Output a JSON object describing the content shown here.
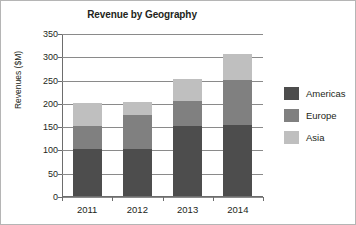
{
  "chart_data": {
    "type": "bar",
    "subtype": "stacked-bar",
    "title": "Revenue by Geography",
    "xlabel": "",
    "ylabel": "Revenues ($M)",
    "categories": [
      "2011",
      "2012",
      "2013",
      "2014"
    ],
    "series": [
      {
        "name": "Americas",
        "color": "#4d4d4d",
        "values": [
          100,
          100,
          150,
          152
        ]
      },
      {
        "name": "Europe",
        "color": "#808080",
        "values": [
          50,
          75,
          55,
          98
        ]
      },
      {
        "name": "Asia",
        "color": "#bfbfbf",
        "values": [
          50,
          27,
          46,
          54
        ]
      }
    ],
    "totals": [
      200,
      202,
      251,
      304
    ],
    "ylim": [
      0,
      350
    ],
    "ytick_values": [
      0,
      50,
      100,
      150,
      200,
      250,
      300,
      350
    ],
    "ytick_labels": [
      "0",
      "50",
      "100",
      "150",
      "200",
      "250",
      "300",
      "350"
    ],
    "grid": true,
    "grid_axis": "y",
    "legend_position": "right",
    "legend_entries": [
      "Americas",
      "Europe",
      "Asia"
    ],
    "border": true,
    "background": "#ffffff"
  }
}
